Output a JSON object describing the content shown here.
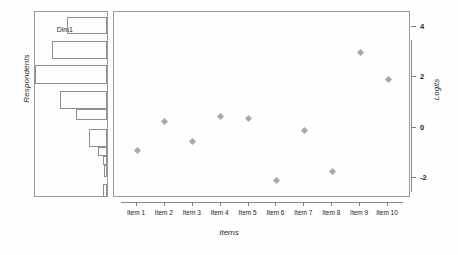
{
  "chart_data": {
    "type": "scatter",
    "title": "",
    "xlabel": "Items",
    "ylabel": "Logits",
    "categories": [
      "Item 1",
      "Item 2",
      "Item 3",
      "Item 4",
      "Item 5",
      "Item 6",
      "Item 7",
      "Item 8",
      "Item 9",
      "Item 10"
    ],
    "values": [
      -0.9,
      0.25,
      -0.55,
      0.45,
      0.35,
      -2.1,
      -0.1,
      -1.75,
      3.0,
      1.9
    ],
    "yticks": [
      4,
      2,
      0,
      -2
    ],
    "ylim": [
      -2.8,
      4.6
    ],
    "grid": false,
    "legend": null,
    "marker": "diamond",
    "marker_color": "#a8a8a8",
    "side_panel": {
      "type": "bar",
      "orientation": "horizontal-left",
      "title": "Dim1",
      "ylabel": "Respondents",
      "bars": [
        {
          "top": 5,
          "height": 17,
          "width": 40
        },
        {
          "top": 22,
          "height": 7,
          "width": 0
        },
        {
          "top": 29,
          "height": 18,
          "width": 55
        },
        {
          "top": 47,
          "height": 6,
          "width": 0
        },
        {
          "top": 53,
          "height": 19,
          "width": 72
        },
        {
          "top": 72,
          "height": 7,
          "width": 0
        },
        {
          "top": 79,
          "height": 18,
          "width": 47
        },
        {
          "top": 97,
          "height": 11,
          "width": 31
        },
        {
          "top": 108,
          "height": 9,
          "width": 0
        },
        {
          "top": 117,
          "height": 18,
          "width": 18
        },
        {
          "top": 135,
          "height": 9,
          "width": 9
        },
        {
          "top": 144,
          "height": 9,
          "width": 4
        },
        {
          "top": 153,
          "height": 12,
          "width": 3
        },
        {
          "top": 165,
          "height": 7,
          "width": 0
        },
        {
          "top": 172,
          "height": 13,
          "width": 4
        }
      ]
    }
  },
  "labels": {
    "respondents": "Respondents",
    "dim": "Dim1",
    "logits": "Logits",
    "items": "Items"
  }
}
